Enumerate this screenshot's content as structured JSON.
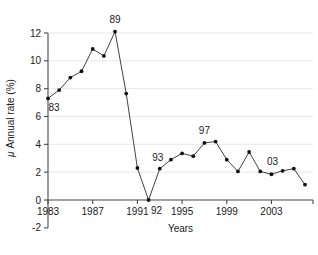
{
  "chart_data": {
    "type": "line",
    "title": "",
    "xlabel": "Years",
    "ylabel": "μ Annual rate (%)",
    "xlim": [
      1983,
      2006
    ],
    "ylim": [
      -2,
      12
    ],
    "grid": true,
    "legend": "none",
    "x_ticks": [
      "1983",
      "1987",
      "1991",
      "1995",
      "1999",
      "2003"
    ],
    "x_tick_values": [
      1983,
      1987,
      1991,
      1995,
      1999,
      2003
    ],
    "y_ticks": [
      "-2",
      "0",
      "2",
      "4",
      "6",
      "8",
      "10",
      "12"
    ],
    "y_tick_values": [
      -2,
      0,
      2,
      4,
      6,
      8,
      10,
      12
    ],
    "x": [
      1983,
      1984,
      1985,
      1986,
      1987,
      1988,
      1989,
      1990,
      1991,
      1992,
      1993,
      1994,
      1995,
      1996,
      1997,
      1998,
      1999,
      2000,
      2001,
      2002,
      2003,
      2004,
      2005,
      2006
    ],
    "values": [
      7.3,
      7.9,
      8.8,
      9.25,
      10.85,
      10.35,
      12.1,
      7.65,
      2.3,
      0.0,
      2.25,
      2.9,
      3.35,
      3.15,
      4.1,
      4.2,
      2.9,
      2.05,
      3.45,
      2.05,
      1.85,
      2.1,
      2.25,
      1.1
    ],
    "series": [
      {
        "name": "μ Annual rate (%)",
        "values": [
          7.3,
          7.9,
          8.8,
          9.25,
          10.85,
          10.35,
          12.1,
          7.65,
          2.3,
          0.0,
          2.25,
          2.9,
          3.35,
          3.15,
          4.1,
          4.2,
          2.9,
          2.05,
          3.45,
          2.05,
          1.85,
          2.1,
          2.25,
          1.1
        ]
      }
    ],
    "annotations": [
      {
        "label": "83",
        "x": 1983,
        "y": 7.3,
        "dx": 6,
        "dy": 13
      },
      {
        "label": "89",
        "x": 1989,
        "y": 12.1,
        "dx": 0,
        "dy": -9
      },
      {
        "label": "92",
        "x": 1992,
        "y": 0.0,
        "dx": 8,
        "dy": 14
      },
      {
        "label": "93",
        "x": 1993,
        "y": 2.25,
        "dx": -2,
        "dy": -8
      },
      {
        "label": "97",
        "x": 1997,
        "y": 4.1,
        "dx": 0,
        "dy": -9
      },
      {
        "label": "03",
        "x": 2003,
        "y": 1.85,
        "dx": 1,
        "dy": -9
      }
    ],
    "marker_style": "filled-circle",
    "line_color": "#2b2b2b",
    "marker_color": "#111111",
    "grid_color": "#e8e8e8",
    "axis_color": "#4a4a4a",
    "background": "#ffffff"
  }
}
